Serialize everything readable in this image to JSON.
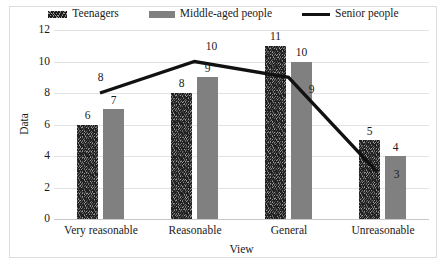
{
  "chart_data": {
    "type": "bar",
    "title": "",
    "xlabel": "View",
    "ylabel": "Data",
    "categories": [
      "Very reasonable",
      "Reasonable",
      "General",
      "Unreasonable"
    ],
    "ylim": [
      0,
      12
    ],
    "yticks": [
      "0",
      "2",
      "4",
      "6",
      "8",
      "10",
      "12"
    ],
    "grid": true,
    "legend_position": "top",
    "series": [
      {
        "name": "Teenagers",
        "type": "bar",
        "style": "textured",
        "color": "#6a6a6a",
        "values": [
          6,
          8,
          11,
          5
        ]
      },
      {
        "name": "Middle-aged people",
        "type": "bar",
        "style": "solid",
        "color": "#808080",
        "values": [
          7,
          9,
          10,
          4
        ]
      },
      {
        "name": "Senior people",
        "type": "line",
        "style": "line",
        "color": "#111111",
        "values": [
          8,
          10,
          9,
          3
        ]
      }
    ],
    "data_labels": {
      "teenagers": [
        "6",
        "8",
        "11",
        "5"
      ],
      "middle_aged": [
        "7",
        "9",
        "10",
        "4"
      ],
      "senior": [
        "8",
        "10",
        "9",
        "3"
      ]
    }
  },
  "legend": {
    "items": [
      {
        "label": "Teenagers",
        "swatch": "textured-swatch-icon"
      },
      {
        "label": "Middle-aged people",
        "swatch": "solid-swatch-icon"
      },
      {
        "label": "Senior people",
        "swatch": "line-swatch-icon"
      }
    ]
  },
  "axes": {
    "y_label": "Data",
    "x_label": "View",
    "y_ticks": [
      "12",
      "10",
      "8",
      "6",
      "4",
      "2",
      "0"
    ],
    "x_categories": [
      "Very reasonable",
      "Reasonable",
      "General",
      "Unreasonable"
    ]
  }
}
